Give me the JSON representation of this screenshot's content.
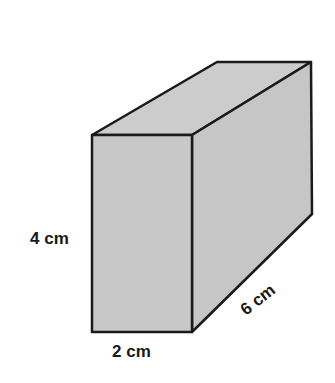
{
  "figure": {
    "type": "rectangular-prism",
    "fill_color": "#c8c8c8",
    "edge_color": "#1a1a1a",
    "labels": {
      "height": "4 cm",
      "width": "2 cm",
      "depth": "6 cm"
    }
  }
}
